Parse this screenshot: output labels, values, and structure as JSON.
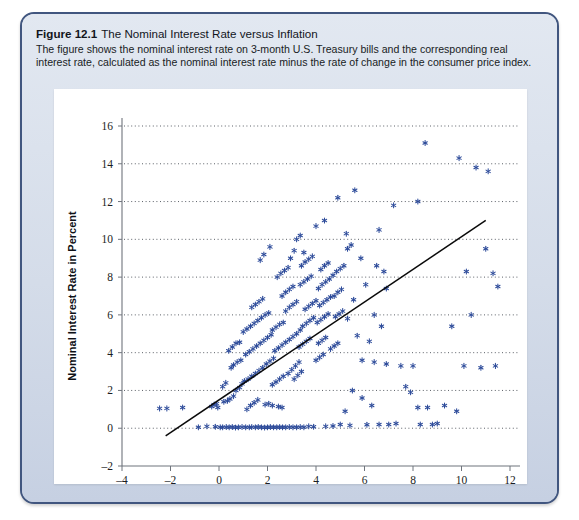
{
  "figure": {
    "number": "Figure 12.1",
    "title": "The Nominal Interest Rate versus Inflation",
    "caption": "The figure shows the nominal interest rate on 3-month U.S. Treasury bills and the corresponding real interest rate, calculated as the nominal interest rate minus the rate of change in the consumer price index."
  },
  "colors": {
    "card_border": "#41567f",
    "card_fill": "#d2dae8",
    "panel_fill": "#ffffff",
    "marker": "#2d4b9a",
    "trend_line": "#0a0a0a",
    "grid": "#4a4f57"
  },
  "chart_data": {
    "type": "scatter",
    "title": "",
    "xlabel": "Inflation Rate in Percent",
    "ylabel": "Nominal Interest Rate in Percent",
    "xlim": [
      -4,
      12
    ],
    "ylim": [
      -2,
      16
    ],
    "xticks": [
      -4,
      -2,
      0,
      2,
      4,
      6,
      8,
      10,
      12
    ],
    "yticks": [
      -2,
      0,
      2,
      4,
      6,
      8,
      10,
      12,
      14,
      16
    ],
    "xtick_labels": [
      "–4",
      "–2",
      "0",
      "2",
      "4",
      "6",
      "8",
      "10",
      "12"
    ],
    "ytick_labels": [
      "–2",
      "0",
      "2",
      "4",
      "6",
      "8",
      "10",
      "12",
      "14",
      "16"
    ],
    "grid": "horizontal-dotted",
    "legend": "none",
    "marker_style": "asterisk",
    "trend_line": {
      "label": "fitted regression line",
      "x": [
        -2.2,
        11.0
      ],
      "y": [
        -0.4,
        11.0
      ]
    },
    "points": [
      [
        -2.45,
        1.05
      ],
      [
        -2.15,
        1.05
      ],
      [
        -1.5,
        1.1
      ],
      [
        -0.85,
        0.05
      ],
      [
        -0.5,
        0.1
      ],
      [
        -0.15,
        0.08
      ],
      [
        -0.3,
        1.15
      ],
      [
        -0.2,
        1.25
      ],
      [
        -0.1,
        1.3
      ],
      [
        -0.05,
        1.1
      ],
      [
        0.05,
        0.05
      ],
      [
        0.15,
        0.05
      ],
      [
        0.3,
        0.06
      ],
      [
        0.42,
        0.05
      ],
      [
        0.55,
        0.07
      ],
      [
        0.68,
        0.04
      ],
      [
        0.8,
        0.05
      ],
      [
        0.95,
        0.06
      ],
      [
        0.2,
        1.4
      ],
      [
        0.35,
        1.45
      ],
      [
        0.45,
        1.55
      ],
      [
        0.6,
        1.7
      ],
      [
        0.7,
        2.0
      ],
      [
        0.85,
        2.15
      ],
      [
        0.95,
        2.35
      ],
      [
        1.05,
        2.5
      ],
      [
        0.5,
        3.2
      ],
      [
        0.6,
        3.35
      ],
      [
        0.75,
        3.5
      ],
      [
        0.9,
        3.6
      ],
      [
        0.4,
        4.1
      ],
      [
        0.55,
        4.3
      ],
      [
        0.7,
        4.5
      ],
      [
        0.85,
        4.55
      ],
      [
        1.1,
        0.05
      ],
      [
        1.25,
        0.05
      ],
      [
        1.35,
        0.06
      ],
      [
        1.5,
        0.05
      ],
      [
        1.62,
        0.07
      ],
      [
        1.75,
        0.05
      ],
      [
        1.88,
        0.04
      ],
      [
        2.0,
        0.05
      ],
      [
        2.12,
        0.06
      ],
      [
        2.25,
        0.05
      ],
      [
        2.38,
        0.05
      ],
      [
        2.5,
        0.06
      ],
      [
        2.62,
        0.05
      ],
      [
        2.75,
        0.05
      ],
      [
        2.9,
        0.06
      ],
      [
        3.05,
        0.05
      ],
      [
        3.2,
        0.05
      ],
      [
        3.35,
        0.06
      ],
      [
        3.5,
        0.05
      ],
      [
        1.15,
        1.0
      ],
      [
        1.3,
        1.2
      ],
      [
        1.45,
        1.35
      ],
      [
        1.6,
        1.5
      ],
      [
        1.2,
        2.6
      ],
      [
        1.35,
        2.75
      ],
      [
        1.5,
        2.9
      ],
      [
        1.65,
        3.05
      ],
      [
        1.8,
        3.2
      ],
      [
        1.95,
        3.4
      ],
      [
        2.1,
        3.55
      ],
      [
        2.25,
        3.7
      ],
      [
        1.1,
        3.9
      ],
      [
        1.25,
        4.05
      ],
      [
        1.4,
        4.2
      ],
      [
        1.55,
        4.35
      ],
      [
        1.7,
        4.5
      ],
      [
        1.85,
        4.65
      ],
      [
        2.0,
        4.8
      ],
      [
        2.15,
        4.95
      ],
      [
        1.0,
        5.1
      ],
      [
        1.15,
        5.25
      ],
      [
        1.3,
        5.4
      ],
      [
        1.45,
        5.55
      ],
      [
        1.6,
        5.7
      ],
      [
        1.75,
        5.85
      ],
      [
        1.9,
        6.0
      ],
      [
        2.05,
        6.1
      ],
      [
        1.35,
        6.4
      ],
      [
        1.5,
        6.55
      ],
      [
        1.65,
        6.7
      ],
      [
        1.8,
        6.85
      ],
      [
        2.2,
        5.2
      ],
      [
        2.35,
        5.35
      ],
      [
        2.5,
        5.5
      ],
      [
        2.65,
        5.6
      ],
      [
        2.3,
        4.1
      ],
      [
        2.45,
        4.25
      ],
      [
        2.6,
        4.4
      ],
      [
        2.75,
        4.55
      ],
      [
        2.2,
        2.3
      ],
      [
        2.35,
        2.45
      ],
      [
        2.5,
        2.6
      ],
      [
        2.65,
        2.75
      ],
      [
        2.85,
        2.9
      ],
      [
        3.0,
        3.1
      ],
      [
        3.15,
        3.3
      ],
      [
        3.3,
        3.5
      ],
      [
        2.9,
        4.7
      ],
      [
        3.05,
        4.85
      ],
      [
        3.2,
        5.0
      ],
      [
        3.35,
        5.2
      ],
      [
        2.75,
        6.2
      ],
      [
        2.9,
        6.4
      ],
      [
        3.05,
        6.55
      ],
      [
        3.2,
        6.7
      ],
      [
        2.6,
        7.0
      ],
      [
        2.75,
        7.2
      ],
      [
        2.9,
        7.35
      ],
      [
        3.05,
        7.5
      ],
      [
        2.4,
        8.0
      ],
      [
        2.55,
        8.2
      ],
      [
        2.7,
        8.35
      ],
      [
        2.85,
        8.5
      ],
      [
        3.35,
        7.6
      ],
      [
        3.5,
        7.75
      ],
      [
        3.65,
        7.9
      ],
      [
        3.8,
        8.05
      ],
      [
        3.4,
        8.6
      ],
      [
        3.55,
        8.8
      ],
      [
        3.7,
        8.95
      ],
      [
        3.85,
        9.1
      ],
      [
        3.55,
        6.3
      ],
      [
        3.7,
        6.45
      ],
      [
        3.85,
        6.6
      ],
      [
        4.0,
        6.75
      ],
      [
        3.45,
        5.4
      ],
      [
        3.6,
        5.55
      ],
      [
        3.75,
        5.7
      ],
      [
        3.9,
        5.85
      ],
      [
        3.3,
        4.3
      ],
      [
        3.45,
        4.45
      ],
      [
        3.6,
        4.6
      ],
      [
        3.75,
        4.75
      ],
      [
        3.1,
        2.6
      ],
      [
        3.25,
        2.8
      ],
      [
        3.4,
        3.0
      ],
      [
        4.1,
        7.4
      ],
      [
        4.25,
        7.6
      ],
      [
        4.4,
        7.75
      ],
      [
        4.55,
        7.9
      ],
      [
        4.2,
        8.4
      ],
      [
        4.35,
        8.6
      ],
      [
        4.5,
        8.75
      ],
      [
        4.15,
        6.5
      ],
      [
        4.3,
        6.65
      ],
      [
        4.45,
        6.8
      ],
      [
        4.6,
        6.95
      ],
      [
        4.05,
        5.6
      ],
      [
        4.2,
        5.75
      ],
      [
        4.35,
        5.9
      ],
      [
        4.5,
        6.05
      ],
      [
        4.1,
        4.5
      ],
      [
        4.25,
        4.65
      ],
      [
        4.4,
        4.8
      ],
      [
        4.0,
        3.6
      ],
      [
        4.15,
        3.75
      ],
      [
        4.3,
        3.9
      ],
      [
        4.7,
        8.1
      ],
      [
        4.85,
        8.3
      ],
      [
        5.0,
        8.45
      ],
      [
        5.15,
        8.6
      ],
      [
        4.75,
        7.0
      ],
      [
        4.9,
        7.2
      ],
      [
        5.05,
        7.35
      ],
      [
        4.8,
        5.9
      ],
      [
        4.95,
        6.05
      ],
      [
        5.1,
        6.2
      ],
      [
        4.6,
        4.2
      ],
      [
        4.75,
        4.35
      ],
      [
        4.9,
        4.5
      ],
      [
        5.3,
        9.5
      ],
      [
        5.45,
        9.7
      ],
      [
        5.25,
        10.3
      ],
      [
        3.2,
        10.0
      ],
      [
        3.35,
        10.2
      ],
      [
        3.1,
        9.4
      ],
      [
        2.95,
        9.0
      ],
      [
        3.5,
        9.3
      ],
      [
        4.0,
        10.7
      ],
      [
        4.35,
        11.0
      ],
      [
        5.6,
        12.6
      ],
      [
        4.9,
        12.2
      ],
      [
        7.2,
        11.8
      ],
      [
        6.6,
        10.5
      ],
      [
        6.5,
        8.6
      ],
      [
        6.8,
        8.3
      ],
      [
        6.9,
        7.4
      ],
      [
        6.4,
        6.0
      ],
      [
        6.7,
        5.4
      ],
      [
        6.2,
        4.6
      ],
      [
        5.9,
        3.6
      ],
      [
        6.4,
        3.5
      ],
      [
        6.9,
        3.4
      ],
      [
        5.5,
        2.0
      ],
      [
        5.9,
        1.6
      ],
      [
        6.3,
        1.2
      ],
      [
        5.2,
        0.9
      ],
      [
        5.0,
        0.2
      ],
      [
        5.4,
        0.15
      ],
      [
        7.5,
        3.3
      ],
      [
        8.0,
        3.3
      ],
      [
        7.7,
        2.2
      ],
      [
        7.9,
        1.9
      ],
      [
        8.2,
        1.1
      ],
      [
        8.6,
        1.1
      ],
      [
        8.3,
        0.2
      ],
      [
        8.8,
        0.2
      ],
      [
        9.0,
        0.25
      ],
      [
        8.5,
        15.1
      ],
      [
        9.9,
        14.3
      ],
      [
        10.6,
        13.8
      ],
      [
        11.1,
        13.6
      ],
      [
        8.2,
        12.0
      ],
      [
        11.0,
        9.5
      ],
      [
        10.2,
        8.3
      ],
      [
        11.3,
        8.2
      ],
      [
        10.4,
        6.0
      ],
      [
        11.5,
        7.5
      ],
      [
        9.6,
        5.4
      ],
      [
        10.1,
        3.3
      ],
      [
        9.3,
        1.2
      ],
      [
        9.8,
        0.9
      ],
      [
        10.8,
        3.2
      ],
      [
        11.4,
        3.3
      ],
      [
        7.0,
        0.2
      ],
      [
        7.3,
        0.25
      ],
      [
        6.1,
        0.18
      ],
      [
        6.6,
        0.2
      ],
      [
        4.4,
        0.1
      ],
      [
        4.7,
        0.12
      ],
      [
        3.9,
        0.08
      ],
      [
        3.7,
        0.1
      ],
      [
        1.9,
        1.25
      ],
      [
        2.05,
        1.3
      ],
      [
        2.2,
        1.2
      ],
      [
        0.15,
        2.2
      ],
      [
        0.28,
        2.4
      ],
      [
        2.45,
        1.15
      ],
      [
        2.6,
        1.1
      ],
      [
        5.7,
        4.9
      ],
      [
        5.3,
        5.8
      ],
      [
        5.55,
        6.8
      ],
      [
        6.05,
        7.6
      ],
      [
        5.85,
        9.0
      ],
      [
        1.7,
        8.9
      ],
      [
        1.85,
        9.2
      ],
      [
        2.1,
        9.6
      ]
    ]
  }
}
